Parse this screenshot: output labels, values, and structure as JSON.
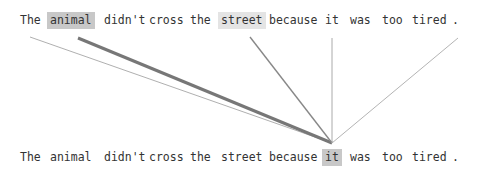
{
  "diagram": {
    "title": "",
    "type": "attention-visualization",
    "focus_token_index": 7,
    "top_tokens": [
      {
        "text": "The",
        "x": 20,
        "highlight": "none"
      },
      {
        "text": "animal",
        "x": 50,
        "highlight": "strong"
      },
      {
        "text": "didn't",
        "x": 104,
        "highlight": "none"
      },
      {
        "text": "cross",
        "x": 149,
        "highlight": "none"
      },
      {
        "text": "the",
        "x": 190,
        "highlight": "none"
      },
      {
        "text": "street",
        "x": 221,
        "highlight": "light"
      },
      {
        "text": "because",
        "x": 269,
        "highlight": "none"
      },
      {
        "text": "it",
        "x": 325,
        "highlight": "none"
      },
      {
        "text": "was",
        "x": 350,
        "highlight": "none"
      },
      {
        "text": "too",
        "x": 382,
        "highlight": "none"
      },
      {
        "text": "tired",
        "x": 412,
        "highlight": "none"
      },
      {
        "text": ".",
        "x": 452,
        "highlight": "none"
      }
    ],
    "bottom_tokens": [
      {
        "text": "The",
        "x": 20,
        "highlight": "none"
      },
      {
        "text": "animal",
        "x": 50,
        "highlight": "none"
      },
      {
        "text": "didn't",
        "x": 104,
        "highlight": "none"
      },
      {
        "text": "cross",
        "x": 149,
        "highlight": "none"
      },
      {
        "text": "the",
        "x": 190,
        "highlight": "none"
      },
      {
        "text": "street",
        "x": 221,
        "highlight": "none"
      },
      {
        "text": "because",
        "x": 269,
        "highlight": "none"
      },
      {
        "text": "it",
        "x": 325,
        "highlight": "strong"
      },
      {
        "text": "was",
        "x": 350,
        "highlight": "none"
      },
      {
        "text": "too",
        "x": 382,
        "highlight": "none"
      },
      {
        "text": "tired",
        "x": 412,
        "highlight": "none"
      },
      {
        "text": ".",
        "x": 452,
        "highlight": "none"
      }
    ],
    "edges": [
      {
        "from": "The",
        "x1": 30,
        "y1": 37,
        "width": 0.8,
        "color": "#9a9a9a"
      },
      {
        "from": "animal",
        "x1": 78,
        "y1": 38,
        "width": 3,
        "color": "#777777"
      },
      {
        "from": "street",
        "x1": 250,
        "y1": 37,
        "width": 1.4,
        "color": "#888888"
      },
      {
        "from": "it",
        "x1": 332,
        "y1": 38,
        "width": 1,
        "color": "#aaaaaa"
      },
      {
        "from": ".",
        "x1": 458,
        "y1": 38,
        "width": 0.9,
        "color": "#aaaaaa"
      }
    ],
    "target_point": {
      "x": 332,
      "y": 143
    }
  }
}
